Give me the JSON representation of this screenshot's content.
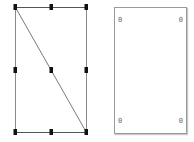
{
  "left_panel": {
    "shape": "rectangle-with-diagonal",
    "rect": {
      "x": 15,
      "y": 7,
      "w": 71,
      "h": 125
    },
    "stroke_color": "#7a7a7a",
    "handle_color": "#111111",
    "handles": [
      {
        "x": 15,
        "y": 7
      },
      {
        "x": 51,
        "y": 7
      },
      {
        "x": 86,
        "y": 7
      },
      {
        "x": 15,
        "y": 70
      },
      {
        "x": 51,
        "y": 70
      },
      {
        "x": 86,
        "y": 70
      },
      {
        "x": 15,
        "y": 132
      },
      {
        "x": 51,
        "y": 132
      },
      {
        "x": 86,
        "y": 132
      }
    ]
  },
  "right_panel": {
    "shape": "rectangle",
    "corner_labels": {
      "top_left": "0",
      "top_right": "0",
      "bottom_left": "0",
      "bottom_right": "0"
    }
  }
}
